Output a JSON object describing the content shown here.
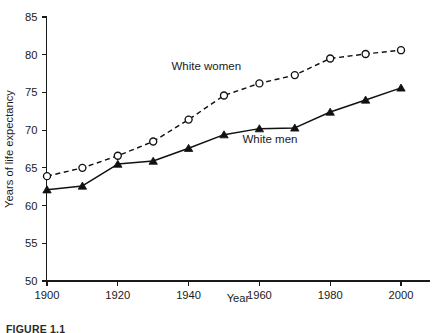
{
  "figure": {
    "caption": "FIGURE 1.1"
  },
  "chart_data": {
    "type": "line",
    "title": "",
    "xlabel": "Year",
    "ylabel": "Years of life expectancy",
    "x": [
      1900,
      1910,
      1920,
      1930,
      1940,
      1950,
      1960,
      1970,
      1980,
      1990,
      2000
    ],
    "xlim": [
      1895,
      2008
    ],
    "ylim": [
      50,
      85
    ],
    "xticks": [
      1900,
      1920,
      1940,
      1960,
      1980,
      2000
    ],
    "xticklabels": [
      "1900",
      "1920",
      "1940",
      "1960",
      "1980",
      "2000"
    ],
    "yticks": [
      50,
      55,
      60,
      65,
      70,
      75,
      80,
      85
    ],
    "yticklabels": [
      "50",
      "55",
      "60",
      "65",
      "70",
      "75",
      "80",
      "85"
    ],
    "grid": false,
    "legend_position": "inline-annotation",
    "series": [
      {
        "name": "White women",
        "label": "White women",
        "marker": "open-circle",
        "linestyle": "dashed",
        "color": "#111111",
        "values": [
          63.9,
          65.0,
          66.6,
          68.5,
          71.4,
          74.6,
          76.2,
          77.3,
          79.5,
          80.1,
          80.6
        ],
        "label_x": 1945,
        "label_y": 78.0
      },
      {
        "name": "White men",
        "label": "White men",
        "marker": "filled-triangle",
        "linestyle": "solid",
        "color": "#111111",
        "values": [
          62.1,
          62.6,
          65.5,
          65.9,
          67.6,
          69.4,
          70.2,
          70.3,
          72.4,
          74.0,
          75.6
        ],
        "label_x": 1963,
        "label_y": 68.3
      }
    ]
  }
}
